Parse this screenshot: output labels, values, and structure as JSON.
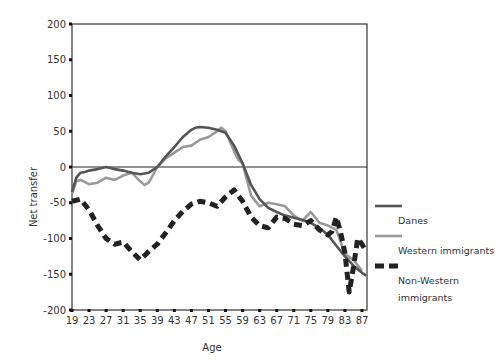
{
  "chart_data": {
    "type": "line",
    "title": "",
    "xlabel": "Age",
    "ylabel": "Net transfer",
    "ylim": [
      -200,
      200
    ],
    "xlim": [
      19,
      88
    ],
    "yticks": [
      200,
      150,
      100,
      50,
      0,
      -50,
      -100,
      -150,
      -200
    ],
    "ytick_labels": [
      "200",
      "150",
      "100",
      "50",
      "0",
      "-50",
      "-100",
      "-150",
      "-200"
    ],
    "xticks": [
      19,
      23,
      27,
      31,
      35,
      39,
      43,
      47,
      51,
      55,
      59,
      63,
      67,
      71,
      75,
      79,
      83,
      87
    ],
    "xtick_labels": [
      "19",
      "23",
      "27",
      "31",
      "35",
      "39",
      "43",
      "47",
      "51",
      "55",
      "59",
      "63",
      "67",
      "71",
      "75",
      "79",
      "83",
      "87"
    ],
    "grid": false,
    "zero_line": true,
    "legend_position": "right",
    "series": [
      {
        "name": "Danes",
        "color": "#555555",
        "style": "solid",
        "x": [
          19,
          20,
          21,
          22,
          23,
          25,
          27,
          29,
          31,
          33,
          35,
          37,
          39,
          41,
          43,
          45,
          47,
          48,
          49,
          51,
          53,
          55,
          57,
          59,
          61,
          63,
          65,
          67,
          69,
          71,
          73,
          75,
          77,
          79,
          81,
          83,
          85,
          87,
          88
        ],
        "values": [
          -35,
          -15,
          -8,
          -7,
          -5,
          -3,
          0,
          -3,
          -5,
          -8,
          -10,
          -8,
          0,
          15,
          28,
          42,
          52,
          55,
          56,
          55,
          52,
          48,
          30,
          5,
          -25,
          -45,
          -57,
          -63,
          -68,
          -71,
          -74,
          -78,
          -85,
          -95,
          -110,
          -125,
          -138,
          -148,
          -152
        ]
      },
      {
        "name": "Western immigrants",
        "color": "#999999",
        "style": "solid",
        "x": [
          19,
          20,
          21,
          23,
          25,
          27,
          29,
          31,
          33,
          35,
          36,
          37,
          39,
          41,
          43,
          45,
          47,
          49,
          51,
          53,
          54,
          55,
          57,
          58,
          59,
          61,
          63,
          65,
          67,
          69,
          71,
          73,
          75,
          77,
          79,
          81,
          83,
          85,
          87
        ],
        "values": [
          -38,
          -20,
          -18,
          -24,
          -22,
          -15,
          -18,
          -12,
          -8,
          -20,
          -25,
          -22,
          0,
          12,
          20,
          28,
          30,
          38,
          42,
          50,
          55,
          50,
          22,
          10,
          5,
          -40,
          -55,
          -50,
          -52,
          -55,
          -68,
          -75,
          -63,
          -78,
          -82,
          -88,
          -122,
          -130,
          -145
        ]
      },
      {
        "name": "Non-Western immigrants",
        "color": "#222222",
        "style": "dashed",
        "x": [
          19,
          21,
          23,
          25,
          27,
          29,
          31,
          33,
          35,
          37,
          39,
          41,
          43,
          45,
          47,
          49,
          51,
          53,
          55,
          57,
          59,
          61,
          63,
          65,
          67,
          69,
          71,
          73,
          75,
          77,
          79,
          80,
          81,
          82,
          83,
          84,
          85,
          86,
          87,
          88
        ],
        "values": [
          -48,
          -45,
          -60,
          -82,
          -100,
          -108,
          -105,
          -118,
          -130,
          -118,
          -108,
          -92,
          -75,
          -62,
          -52,
          -48,
          -50,
          -55,
          -42,
          -32,
          -48,
          -70,
          -82,
          -85,
          -70,
          -72,
          -80,
          -82,
          -75,
          -88,
          -95,
          -90,
          -70,
          -92,
          -120,
          -175,
          -140,
          -100,
          -108,
          -118
        ]
      }
    ],
    "legend": [
      {
        "label_lines": [
          "Danes"
        ],
        "color": "#555555",
        "style": "solid"
      },
      {
        "label_lines": [
          "Western immigrants"
        ],
        "color": "#999999",
        "style": "solid"
      },
      {
        "label_lines": [
          "Non-Western",
          "immigrants"
        ],
        "color": "#222222",
        "style": "dashed"
      }
    ]
  }
}
